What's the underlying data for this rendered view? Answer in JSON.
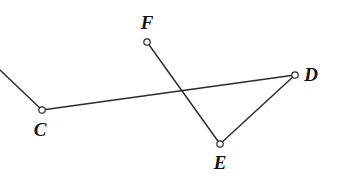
{
  "figure": {
    "type": "geometry-diagram",
    "width": 340,
    "height": 189,
    "background_color": "#ffffff",
    "stroke_color": "#2b2b2b",
    "vertex_fill_color": "#ffffff",
    "label_color": "#15120f"
  },
  "vertices": [
    {
      "id": "C",
      "label": "C",
      "x": 42,
      "y": 110,
      "label_x": 40,
      "label_y": 129,
      "radius": 3.2
    },
    {
      "id": "D",
      "label": "D",
      "x": 295,
      "y": 75,
      "label_x": 311,
      "label_y": 74,
      "radius": 3.2
    },
    {
      "id": "E",
      "label": "E",
      "x": 220,
      "y": 144,
      "label_x": 220,
      "label_y": 162,
      "radius": 3.2
    },
    {
      "id": "F",
      "label": "F",
      "x": 147,
      "y": 42,
      "label_x": 147,
      "label_y": 22,
      "radius": 3.2
    }
  ],
  "edges": [
    {
      "id": "edge-open-C",
      "from": "open-left",
      "to": "C",
      "x1": 0,
      "y1": 70,
      "x2": 42,
      "y2": 110
    },
    {
      "id": "edge-C-D",
      "from": "C",
      "to": "D",
      "x1": 42,
      "y1": 110,
      "x2": 295,
      "y2": 75
    },
    {
      "id": "edge-D-E",
      "from": "D",
      "to": "E",
      "x1": 295,
      "y1": 75,
      "x2": 220,
      "y2": 144
    },
    {
      "id": "edge-F-E",
      "from": "F",
      "to": "E",
      "x1": 147,
      "y1": 42,
      "x2": 220,
      "y2": 144
    }
  ],
  "crossings": [
    {
      "id": "crossing-CD-FE",
      "x": 182,
      "y": 95,
      "marked": false
    }
  ]
}
